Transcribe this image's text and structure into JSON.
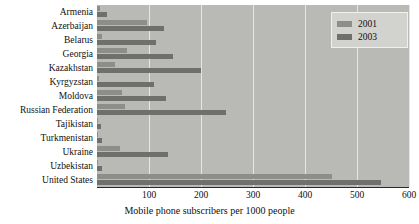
{
  "chart_data": {
    "type": "bar",
    "orientation": "horizontal",
    "title": "",
    "xlabel": "Mobile phone subscribers per 1000 people",
    "ylabel": "",
    "xlim": [
      0,
      600
    ],
    "xticks": [
      0,
      100,
      200,
      300,
      400,
      500,
      600
    ],
    "xticklabels": [
      "",
      "100",
      "200",
      "300",
      "400",
      "500",
      "600"
    ],
    "grid": true,
    "grid_axis": "x",
    "legend_position": "upper right",
    "categories": [
      "Armenia",
      "Azerbaijan",
      "Belarus",
      "Georgia",
      "Kazakhstan",
      "Kyrgyzstan",
      "Moldova",
      "Russian Federation",
      "Tajikistan",
      "Turkmenistan",
      "Ukraine",
      "Uzbekistan",
      "United States"
    ],
    "series": [
      {
        "name": "2001",
        "color": "#8d8d8a",
        "values": [
          6,
          97,
          9,
          57,
          35,
          3,
          48,
          53,
          1,
          1,
          44,
          1,
          451
        ]
      },
      {
        "name": "2003",
        "color": "#6f6f6d",
        "values": [
          19,
          128,
          113,
          146,
          200,
          110,
          132,
          249,
          7,
          10,
          136,
          10,
          546
        ]
      }
    ],
    "plot_background_color": "#b9b9b5",
    "gridline_color": "#e6e6e2",
    "axis_color": "#2a2a2a"
  },
  "legend": {
    "items": [
      {
        "label": "2001",
        "color": "#8d8d8a"
      },
      {
        "label": "2003",
        "color": "#6f6f6d"
      }
    ]
  }
}
